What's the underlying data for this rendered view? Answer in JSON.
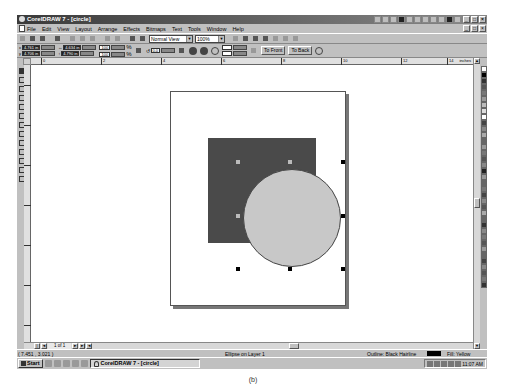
{
  "window": {
    "title": "CorelDRAW 7 - [circle]",
    "controls": [
      "minimize",
      "maximize",
      "close"
    ]
  },
  "menubar": {
    "items": [
      "File",
      "Edit",
      "View",
      "Layout",
      "Arrange",
      "Effects",
      "Bitmaps",
      "Text",
      "Tools",
      "Window",
      "Help"
    ]
  },
  "toolbar": {
    "view_mode": "Normal View",
    "zoom_level": "100%"
  },
  "property_bar": {
    "x_pos": "4.761 in",
    "y_pos": "4.706 in",
    "width": "4.634 in",
    "height": "4.790 in",
    "scale_x": "100",
    "scale_y": "100",
    "scale_unit": "%",
    "rotation": "0.0",
    "to_front_label": "To Front",
    "to_back_label": "To Back"
  },
  "ruler": {
    "units": "inches",
    "h_labels": [
      "0",
      "2",
      "4",
      "6",
      "8",
      "10",
      "12",
      "14"
    ]
  },
  "page_nav": {
    "label": "1 of 1"
  },
  "status": {
    "coords": "( 7.451 , 3.021 )",
    "selection": "Ellipse on Layer 1",
    "outline": "Outline: Black  Hairline",
    "fill": "Fill: Yellow",
    "colors": {
      "outline": "#000000"
    }
  },
  "taskbar": {
    "start_label": "Start",
    "task_item": "CorelDRAW 7 - [circle]",
    "clock": "11:07 AM"
  },
  "caption": "(b)",
  "canvas": {
    "colors": {
      "rectangle": "#4a4a4a",
      "circle": "#c8c8c8"
    }
  }
}
